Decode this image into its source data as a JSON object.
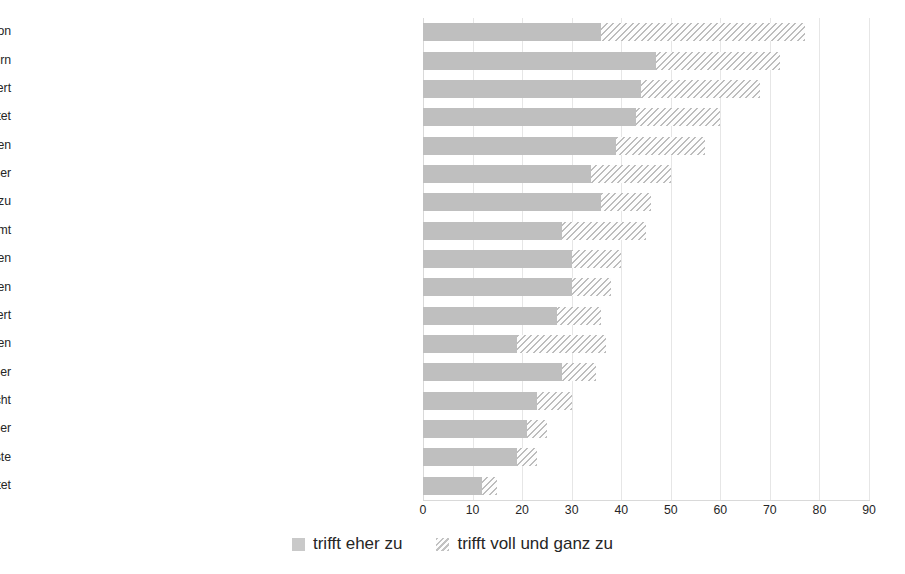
{
  "chart_data": {
    "type": "bar",
    "orientation": "horizontal",
    "stacked": true,
    "title": "",
    "subtitle": "",
    "xlabel": "",
    "ylabel": "",
    "xlim": [
      0,
      90
    ],
    "xticks": [
      "0",
      "10",
      "20",
      "30",
      "40",
      "50",
      "60",
      "70",
      "80",
      "90"
    ],
    "xtick_step": 10,
    "grid": true,
    "grid_axis": "x",
    "legend_position": "bottom",
    "colors": {
      "series_1": "#bfbfbf",
      "series_2_hatch": "#bdbdbd",
      "background": "#ffffff",
      "gridline": "#e6e6e6",
      "text": "#262626"
    },
    "categories": [
      "Besserer Zugang zu Wissen und Information",
      "Besserer Zugang zu Kooperationspartnern",
      "Arbeitsalltag wird erleichtert",
      "Die Arbeit wird verdichtet",
      "Anforderungen an die Selbstorganisation steigen",
      "Gestaltungsspielräume der Arbeit werden größer",
      "Umstellungs- und Lernanforderungen nehmen zu",
      "Traditionelle Grenze von Privat- und Arbeitszeit verschwimmt",
      "Anforderungen an die Mobilität sinken",
      "Die Kultur der Zusammenarbeit verändert sich zum Positiven",
      "Abläufe werden stärker strukturiert,  reglementiert",
      "Überflutung mit Informationen",
      "Unternehmensstrukturen werden offener und durchlässiger",
      "Selbstbestimmtes Arbeiten und Leben wird ermöglicht",
      "Die Arbeit wird belastender",
      "Kontrollpotenziale der Anwendungen schüren Ängste",
      "Mitsprachemöglichkeiten der Beschäftigten werden ausgeweitet"
    ],
    "series": [
      {
        "name": "trifft eher zu",
        "style": "solid",
        "values": [
          36,
          47,
          44,
          43,
          39,
          34,
          36,
          28,
          30,
          30,
          27,
          19,
          28,
          23,
          21,
          19,
          12
        ]
      },
      {
        "name": "trifft voll und ganz zu",
        "style": "hatched",
        "values": [
          41,
          25,
          24,
          17,
          18,
          16,
          10,
          17,
          10,
          8,
          9,
          18,
          7,
          7,
          4,
          4,
          3
        ]
      }
    ],
    "totals": [
      77,
      72,
      68,
      60,
      57,
      50,
      46,
      45,
      40,
      38,
      36,
      37,
      35,
      30,
      25,
      23,
      15
    ]
  },
  "legend": {
    "items": [
      {
        "label": "trifft eher zu",
        "swatch": "solid"
      },
      {
        "label": "trifft voll und ganz zu",
        "swatch": "hatch"
      }
    ]
  }
}
